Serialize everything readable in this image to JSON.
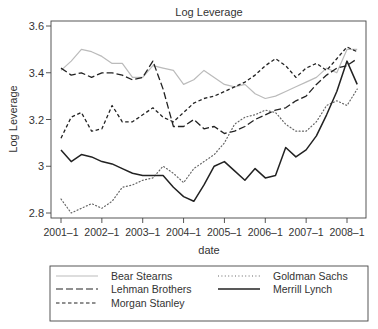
{
  "chart_data": {
    "type": "line",
    "title": "Log Leverage",
    "xlabel": "date",
    "ylabel": "Log Leverage",
    "ylim": [
      2.78,
      3.62
    ],
    "xlim": [
      2000.75,
      2008.45
    ],
    "grid": false,
    "legend_position": "bottom",
    "x_ticks": [
      {
        "value": 2001.0,
        "label": "2001–1"
      },
      {
        "value": 2002.0,
        "label": "2002–1"
      },
      {
        "value": 2003.0,
        "label": "2003–1"
      },
      {
        "value": 2004.0,
        "label": "2004–1"
      },
      {
        "value": 2005.0,
        "label": "2005–1"
      },
      {
        "value": 2006.0,
        "label": "2006–1"
      },
      {
        "value": 2007.0,
        "label": "2007–1"
      },
      {
        "value": 2008.0,
        "label": "2008–1"
      }
    ],
    "y_ticks": [
      {
        "value": 2.8,
        "label": "2.8"
      },
      {
        "value": 3.0,
        "label": "3"
      },
      {
        "value": 3.2,
        "label": "3.2"
      },
      {
        "value": 3.4,
        "label": "3.4"
      },
      {
        "value": 3.6,
        "label": "3.6"
      }
    ],
    "x": [
      2001.0,
      2001.25,
      2001.5,
      2001.75,
      2002.0,
      2002.25,
      2002.5,
      2002.75,
      2003.0,
      2003.25,
      2003.5,
      2003.75,
      2004.0,
      2004.25,
      2004.5,
      2004.75,
      2005.0,
      2005.25,
      2005.5,
      2005.75,
      2006.0,
      2006.25,
      2006.5,
      2006.75,
      2007.0,
      2007.25,
      2007.5,
      2007.75,
      2008.0,
      2008.25
    ],
    "series": [
      {
        "name": "Bear Stearns",
        "style": "solid",
        "color": "#bbbbbb",
        "width": 1.2,
        "values": [
          3.41,
          3.45,
          3.5,
          3.49,
          3.47,
          3.44,
          3.44,
          3.38,
          3.38,
          3.43,
          3.42,
          3.41,
          3.35,
          3.37,
          3.41,
          3.38,
          3.35,
          3.34,
          3.35,
          3.31,
          3.29,
          3.3,
          3.32,
          3.34,
          3.36,
          3.38,
          3.42,
          3.4,
          3.5,
          3.5
        ]
      },
      {
        "name": "Lehman Brothers",
        "style": "longdash",
        "color": "#222222",
        "width": 1.3,
        "values": [
          3.42,
          3.39,
          3.4,
          3.38,
          3.4,
          3.4,
          3.39,
          3.37,
          3.38,
          3.45,
          3.33,
          3.17,
          3.17,
          3.2,
          3.16,
          3.17,
          3.14,
          3.15,
          3.17,
          3.2,
          3.22,
          3.24,
          3.25,
          3.28,
          3.3,
          3.35,
          3.39,
          3.42,
          3.43,
          3.46
        ]
      },
      {
        "name": "Morgan Stanley",
        "style": "shortdash",
        "color": "#222222",
        "width": 1.3,
        "values": [
          3.12,
          3.21,
          3.23,
          3.15,
          3.16,
          3.26,
          3.19,
          3.19,
          3.22,
          3.25,
          3.21,
          3.19,
          3.23,
          3.27,
          3.29,
          3.3,
          3.32,
          3.34,
          3.36,
          3.39,
          3.43,
          3.46,
          3.43,
          3.38,
          3.42,
          3.44,
          3.41,
          3.46,
          3.51,
          3.49
        ]
      },
      {
        "name": "Goldman Sachs",
        "style": "dotted",
        "color": "#666666",
        "width": 1.2,
        "values": [
          2.86,
          2.8,
          2.82,
          2.84,
          2.82,
          2.85,
          2.91,
          2.92,
          2.94,
          2.95,
          3.0,
          2.97,
          2.93,
          2.99,
          3.02,
          3.05,
          3.1,
          3.18,
          3.21,
          3.22,
          3.24,
          3.23,
          3.18,
          3.15,
          3.15,
          3.19,
          3.26,
          3.28,
          3.26,
          3.33
        ]
      },
      {
        "name": "Merrill Lynch",
        "style": "solid",
        "color": "#222222",
        "width": 1.5,
        "values": [
          3.07,
          3.02,
          3.05,
          3.04,
          3.02,
          3.01,
          2.99,
          2.97,
          2.96,
          2.96,
          2.96,
          2.91,
          2.87,
          2.85,
          2.92,
          3.0,
          3.02,
          2.98,
          2.94,
          2.99,
          2.95,
          2.96,
          3.08,
          3.04,
          3.07,
          3.13,
          3.22,
          3.32,
          3.45,
          3.35
        ]
      }
    ]
  },
  "legend": {
    "items": [
      {
        "label": "Bear Stearns",
        "style": "solid",
        "color": "#bbbbbb"
      },
      {
        "label": "Goldman Sachs",
        "style": "dotted",
        "color": "#666666"
      },
      {
        "label": "Lehman Brothers",
        "style": "longdash",
        "color": "#222222"
      },
      {
        "label": "Merrill Lynch",
        "style": "solid",
        "color": "#222222"
      },
      {
        "label": "Morgan Stanley",
        "style": "shortdash",
        "color": "#222222"
      }
    ]
  }
}
